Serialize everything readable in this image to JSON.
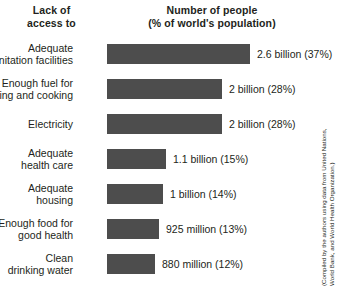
{
  "header": {
    "left_line1": "Lack of",
    "left_line2": "access to",
    "right_line1": "Number of people",
    "right_line2": "(% of world's population)"
  },
  "source_note": {
    "line1": "(Compiled by the authors using data from United Nations,",
    "line2": "World Bank, and World Health Organization.)"
  },
  "colors": {
    "bar": "#4d4d4d",
    "text": "#231f20",
    "background": "#ffffff"
  },
  "rows": [
    {
      "label_line1": "Adequate",
      "label_line2": "sanitation facilities",
      "value": "2.6 billion (37%)",
      "percent": 37,
      "bar_width": "143px"
    },
    {
      "label_line1": "Enough fuel for",
      "label_line2": "heating and cooking",
      "value": "2 billion (28%)",
      "percent": 28,
      "bar_width": "115px"
    },
    {
      "label_line1": "Electricity",
      "label_line2": "",
      "value": "2 billion (28%)",
      "percent": 28,
      "bar_width": "115px"
    },
    {
      "label_line1": "Adequate",
      "label_line2": "health care",
      "value": "1.1 billion (15%)",
      "percent": 15,
      "bar_width": "59px"
    },
    {
      "label_line1": "Adequate",
      "label_line2": "housing",
      "value": "1 billion (14%)",
      "percent": 14,
      "bar_width": "56px"
    },
    {
      "label_line1": "Enough food for",
      "label_line2": "good health",
      "value": "925 million (13%)",
      "percent": 13,
      "bar_width": "52px"
    },
    {
      "label_line1": "Clean",
      "label_line2": "drinking water",
      "value": "880 million (12%)",
      "percent": 12,
      "bar_width": "48px"
    }
  ],
  "chart_data": {
    "type": "bar",
    "orientation": "horizontal",
    "title": "Number of people (% of world's population)",
    "xlabel": "Number of people (% of world's population)",
    "ylabel": "Lack of access to",
    "categories": [
      "Adequate sanitation facilities",
      "Enough fuel for heating and cooking",
      "Electricity",
      "Adequate health care",
      "Adequate housing",
      "Enough food for good health",
      "Clean drinking water"
    ],
    "values": [
      37,
      28,
      28,
      15,
      14,
      13,
      12
    ],
    "value_unit": "% of world's population",
    "data_labels": [
      "2.6 billion (37%)",
      "2 billion (28%)",
      "2 billion (28%)",
      "1.1 billion (15%)",
      "1 billion (14%)",
      "925 million (13%)",
      "880 million (12%)"
    ],
    "absolute_values": [
      2600000000,
      2000000000,
      2000000000,
      1100000000,
      1000000000,
      925000000,
      880000000
    ],
    "xlim": [
      0,
      37
    ],
    "grid": false,
    "legend": "none",
    "series_color": "#4d4d4d",
    "annotation": "(Compiled by the authors using data from United Nations, World Bank, and World Health Organization.)"
  }
}
